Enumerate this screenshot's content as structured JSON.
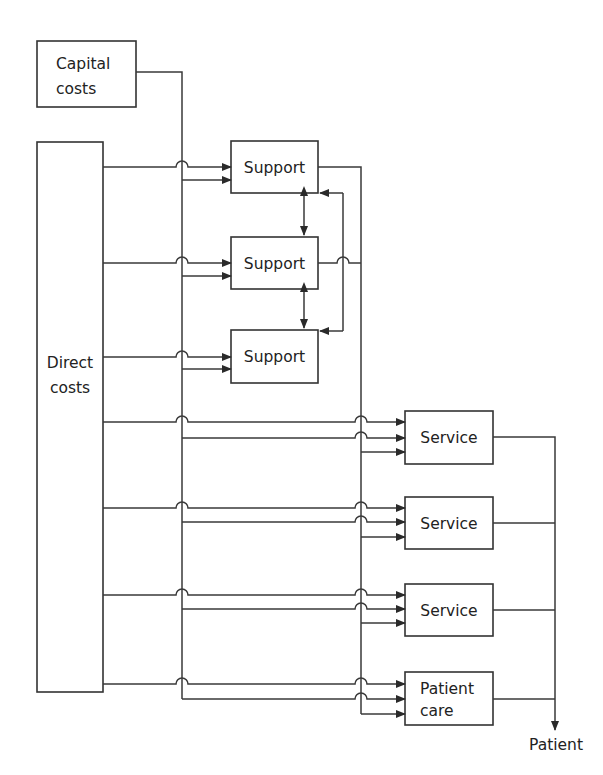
{
  "diagram": {
    "type": "cost-allocation-flow",
    "nodes": {
      "capital_costs": {
        "label_lines": [
          "Capital",
          "costs"
        ]
      },
      "direct_costs": {
        "label_lines": [
          "Direct",
          "costs"
        ]
      },
      "support_1": {
        "label": "Support"
      },
      "support_2": {
        "label": "Support"
      },
      "support_3": {
        "label": "Support"
      },
      "service_1": {
        "label": "Service"
      },
      "service_2": {
        "label": "Service"
      },
      "service_3": {
        "label": "Service"
      },
      "patient_care": {
        "label_lines": [
          "Patient",
          "care"
        ]
      },
      "patient": {
        "label": "Patient"
      }
    },
    "edges": [
      {
        "from": "capital_costs",
        "to": "support_1"
      },
      {
        "from": "capital_costs",
        "to": "support_2"
      },
      {
        "from": "capital_costs",
        "to": "support_3"
      },
      {
        "from": "capital_costs",
        "to": "service_1"
      },
      {
        "from": "capital_costs",
        "to": "service_2"
      },
      {
        "from": "capital_costs",
        "to": "service_3"
      },
      {
        "from": "capital_costs",
        "to": "patient_care"
      },
      {
        "from": "direct_costs",
        "to": "support_1"
      },
      {
        "from": "direct_costs",
        "to": "support_2"
      },
      {
        "from": "direct_costs",
        "to": "support_3"
      },
      {
        "from": "direct_costs",
        "to": "service_1"
      },
      {
        "from": "direct_costs",
        "to": "service_2"
      },
      {
        "from": "direct_costs",
        "to": "service_3"
      },
      {
        "from": "direct_costs",
        "to": "patient_care"
      },
      {
        "from": "support_1",
        "to": "support_2",
        "bidirectional": true
      },
      {
        "from": "support_2",
        "to": "support_3",
        "bidirectional": true
      },
      {
        "from": "support_1",
        "to": "service_1"
      },
      {
        "from": "support_1",
        "to": "service_2"
      },
      {
        "from": "support_1",
        "to": "service_3"
      },
      {
        "from": "support_1",
        "to": "patient_care"
      },
      {
        "from": "support_2",
        "to": "service_1"
      },
      {
        "from": "support_2",
        "to": "service_2"
      },
      {
        "from": "support_2",
        "to": "service_3"
      },
      {
        "from": "support_2",
        "to": "patient_care"
      },
      {
        "from": "feedback",
        "to": "support_1"
      },
      {
        "from": "feedback",
        "to": "support_3"
      },
      {
        "from": "service_1",
        "to": "patient"
      },
      {
        "from": "service_2",
        "to": "patient"
      },
      {
        "from": "service_3",
        "to": "patient"
      },
      {
        "from": "patient_care",
        "to": "patient"
      }
    ]
  }
}
